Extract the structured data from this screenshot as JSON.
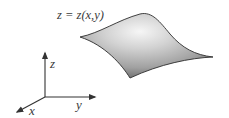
{
  "diagram": {
    "title": "z = z(x,y)",
    "type": "3D surface with coordinate axes",
    "surface": {
      "label": "z = z(x,y)",
      "fill_highlight": "#f4f4f4",
      "fill_mid": "#bdbdbd",
      "fill_shadow": "#6e6e6e",
      "edge_color": "#2e2e2e"
    },
    "axes": {
      "color": "#333333",
      "items": [
        {
          "name": "z",
          "label": "z",
          "direction": "up"
        },
        {
          "name": "y",
          "label": "y",
          "direction": "right"
        },
        {
          "name": "x",
          "label": "x",
          "direction": "down-left"
        }
      ]
    }
  }
}
